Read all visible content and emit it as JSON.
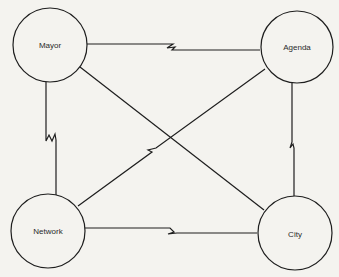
{
  "diagram": {
    "type": "network-graph",
    "nodes": [
      {
        "id": "mayor",
        "label": "Mayor",
        "cx": 50,
        "cy": 45,
        "r": 37
      },
      {
        "id": "agenda",
        "label": "Agenda",
        "cx": 297,
        "cy": 47,
        "r": 36
      },
      {
        "id": "network",
        "label": "Network",
        "cx": 48,
        "cy": 231,
        "r": 37
      },
      {
        "id": "city",
        "label": "City",
        "cx": 295,
        "cy": 233,
        "r": 37
      }
    ],
    "edges": [
      {
        "from": "Mayor",
        "to": "Agenda",
        "broken": true
      },
      {
        "from": "Mayor",
        "to": "Network",
        "broken": true
      },
      {
        "from": "Agenda",
        "to": "City",
        "broken": true
      },
      {
        "from": "Network",
        "to": "City",
        "broken": true
      },
      {
        "from": "Network",
        "to": "Agenda",
        "broken": true
      },
      {
        "from": "Mayor",
        "to": "City",
        "broken": false
      }
    ],
    "colors": {
      "line": "#1e1e1e",
      "background": "#f4f3ef"
    }
  }
}
